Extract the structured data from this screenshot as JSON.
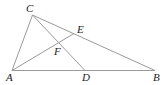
{
  "diagram": {
    "type": "geometry",
    "points": {
      "A": {
        "label": "A",
        "x": 12,
        "y": 70.5,
        "lx": 6,
        "ly": 81
      },
      "B": {
        "label": "B",
        "x": 155,
        "y": 70.5,
        "lx": 153,
        "ly": 81
      },
      "C": {
        "label": "C",
        "x": 32.5,
        "y": 15,
        "lx": 26,
        "ly": 12
      },
      "D": {
        "label": "D",
        "x": 85,
        "y": 70.5,
        "lx": 82,
        "ly": 81
      },
      "E": {
        "label": "E",
        "x": 74,
        "y": 33.5,
        "lx": 77,
        "ly": 33
      },
      "F": {
        "label": "F",
        "x": 59.5,
        "y": 42.5,
        "lx": 54,
        "ly": 55
      }
    },
    "segments": [
      [
        "A",
        "B"
      ],
      [
        "A",
        "C"
      ],
      [
        "C",
        "B"
      ],
      [
        "C",
        "D"
      ],
      [
        "A",
        "E"
      ]
    ],
    "colors": {
      "line": "#9a9a9a",
      "label": "#222222"
    }
  }
}
